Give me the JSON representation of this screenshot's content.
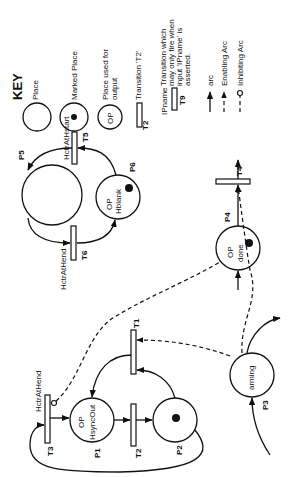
{
  "key": {
    "title": "KEY",
    "items": [
      {
        "symbol": "place",
        "label": "Place"
      },
      {
        "symbol": "marked-place",
        "label": "Marked  Place"
      },
      {
        "symbol": "output-place",
        "symbol_text": "OP",
        "label_lines": [
          "Place used for",
          "output"
        ]
      },
      {
        "symbol": "transition",
        "symbol_text": "T2",
        "label": "Transition 'T2'"
      },
      {
        "symbol": "input-transition",
        "symbol_text_top": "IPname",
        "symbol_text_bottom": "T9",
        "label_lines": [
          "Transition which",
          "may only fire when",
          "input 'IPname' is",
          "asserted."
        ]
      },
      {
        "symbol": "arc",
        "label": "arc"
      },
      {
        "symbol": "enabling-arc",
        "label": "Enabling Arc"
      },
      {
        "symbol": "inhibiting-arc",
        "label": "Inhibiting Arc"
      }
    ]
  },
  "places": {
    "P1": {
      "name": "P1",
      "op": "OP",
      "text": "HsyncOut",
      "marked": false
    },
    "P2": {
      "name": "P2",
      "marked": true
    },
    "P3": {
      "name": "P3",
      "text": "arming",
      "marked": false
    },
    "P4": {
      "name": "P4",
      "op": "OP",
      "text": "done",
      "marked": true
    },
    "P5": {
      "name": "P5",
      "marked": false
    },
    "P6": {
      "name": "P6",
      "op": "OP",
      "text": "Hblank",
      "marked": true
    }
  },
  "transitions": {
    "T1": {
      "name": "T1"
    },
    "T2": {
      "name": "T2"
    },
    "T3": {
      "name": "T3",
      "input": "HctrAtHend"
    },
    "T4": {
      "name": "T4"
    },
    "T5": {
      "name": "T5",
      "input": "HctrAtHstart"
    },
    "T6": {
      "name": "T6",
      "input": "HctrAtHend"
    }
  }
}
